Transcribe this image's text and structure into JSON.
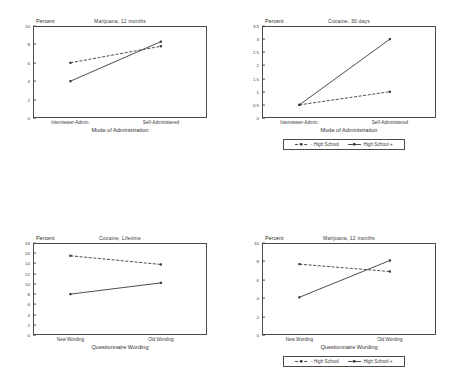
{
  "figure": {
    "panel_count": 4,
    "background_color": "#ffffff",
    "line_color": "#3a3a3a"
  },
  "legend": {
    "entries": [
      {
        "label": "- High School",
        "style": "dashed",
        "marker": "square"
      },
      {
        "label": "High School +",
        "style": "solid",
        "marker": "square"
      }
    ]
  },
  "chart_data": [
    {
      "id": "panel-top-left",
      "type": "line",
      "title": "Marijuana, 12 months",
      "xlabel": "Mode of Administration",
      "ylabel": "Percent",
      "categories": [
        "Interviewer-Admin.",
        "Self-Administered"
      ],
      "ylim": [
        0,
        10
      ],
      "yticks": [
        0,
        2,
        4,
        6,
        8,
        10
      ],
      "ytick_labels": [
        "0",
        "2",
        "4",
        "6",
        "8",
        "10"
      ],
      "grid": false,
      "legend_position": "none",
      "series": [
        {
          "name": "- High School",
          "style": "dashed",
          "values": [
            6.0,
            7.8
          ]
        },
        {
          "name": "High School +",
          "style": "solid",
          "values": [
            4.0,
            8.3
          ]
        }
      ]
    },
    {
      "id": "panel-top-right",
      "type": "line",
      "title": "Cocaine, 30 days",
      "xlabel": "Mode of Administration",
      "ylabel": "Percent",
      "categories": [
        "Interviewer-Admin.",
        "Self-Administered"
      ],
      "ylim": [
        0,
        3.5
      ],
      "yticks": [
        0,
        0.5,
        1,
        1.5,
        2,
        2.5,
        3,
        3.5
      ],
      "ytick_labels": [
        "0",
        "0.5",
        "1",
        "1.5",
        "2",
        "2.5",
        "3",
        "3.5"
      ],
      "grid": false,
      "legend_position": "below",
      "series": [
        {
          "name": "- High School",
          "style": "dashed",
          "values": [
            0.5,
            1.0
          ]
        },
        {
          "name": "High School +",
          "style": "solid",
          "values": [
            0.5,
            3.0
          ]
        }
      ]
    },
    {
      "id": "panel-bottom-left",
      "type": "line",
      "title": "Cocaine, Lifetime",
      "xlabel": "Questionnaire Wording",
      "ylabel": "Percent",
      "categories": [
        "New Wording",
        "Old Wording"
      ],
      "ylim": [
        0,
        18
      ],
      "yticks": [
        0,
        2,
        4,
        6,
        8,
        10,
        12,
        14,
        16,
        18
      ],
      "ytick_labels": [
        "0",
        "2",
        "4",
        "6",
        "8",
        "10",
        "12",
        "14",
        "16",
        "18"
      ],
      "grid": false,
      "legend_position": "none",
      "series": [
        {
          "name": "- High School",
          "style": "dashed",
          "values": [
            15.5,
            13.8
          ]
        },
        {
          "name": "High School +",
          "style": "solid",
          "values": [
            8.0,
            10.2
          ]
        }
      ]
    },
    {
      "id": "panel-bottom-right",
      "type": "line",
      "title": "Marijuana, 12 months",
      "xlabel": "Questionnaire Wording",
      "ylabel": "Percent",
      "categories": [
        "New Wording",
        "Old Wording"
      ],
      "ylim": [
        0,
        10
      ],
      "yticks": [
        0,
        2,
        4,
        6,
        8,
        10
      ],
      "ytick_labels": [
        "0",
        "2",
        "4",
        "6",
        "8",
        "10"
      ],
      "grid": false,
      "legend_position": "below",
      "series": [
        {
          "name": "- High School",
          "style": "dashed",
          "values": [
            7.7,
            6.9
          ]
        },
        {
          "name": "High School +",
          "style": "solid",
          "values": [
            4.1,
            8.1
          ]
        }
      ]
    }
  ]
}
